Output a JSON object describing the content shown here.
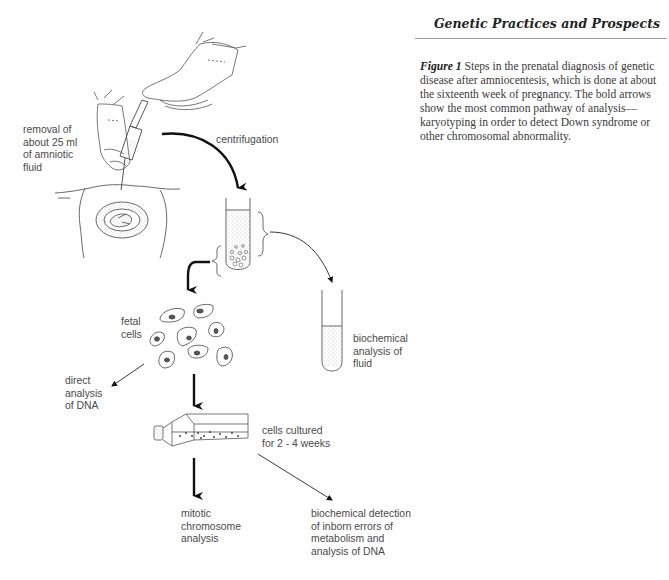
{
  "header": {
    "running_title": "Genetic Practices and Prospects"
  },
  "caption": {
    "figure_label": "Figure 1",
    "text": "  Steps in the prenatal diagnosis of genetic disease after amniocentesis, which is done at about the sixteenth week of pregnancy. The bold arrows show the most common pathway of analysis—karyotyping in order to detect Down syndrome or other chromosomal abnormality."
  },
  "diagram": {
    "steps": {
      "removal": "removal of\nabout 25 ml\nof amniotic\nfluid",
      "centrifugation": "centrifugation",
      "fetal_cells": "fetal\ncells",
      "biochemical_fluid": "biochemical\nanalysis of\nfluid",
      "direct_dna": "direct\nanalysis\nof DNA",
      "cultured": "cells cultured\nfor 2 - 4 weeks",
      "mitotic": "mitotic\nchromosome\nanalysis",
      "biochemical_detection": "biochemical detection\nof inborn errors of\nmetabolism and\nanalysis of DNA"
    },
    "colors": {
      "line": "#1a1a1a",
      "text": "#4a4a4a"
    }
  }
}
